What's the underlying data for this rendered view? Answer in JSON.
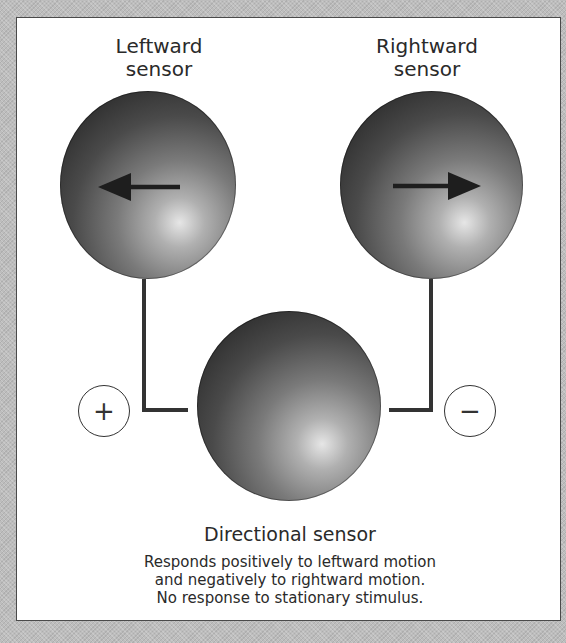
{
  "diagram": {
    "left_sensor": {
      "label_line1": "Leftward",
      "label_line2": "sensor",
      "arrow_direction": "left"
    },
    "right_sensor": {
      "label_line1": "Rightward",
      "label_line2": "sensor",
      "arrow_direction": "right"
    },
    "directional_sensor": {
      "title": "Directional sensor",
      "description_line1": "Responds positively to leftward motion",
      "description_line2": "and negatively to rightward motion.",
      "description_line3": "No response to stationary stimulus."
    },
    "left_connection_sign": "+",
    "right_connection_sign": "−",
    "colors": {
      "background": "#bdbdbd",
      "panel": "#ffffff",
      "connector": "#333333",
      "sphere_dark": "#232323",
      "sphere_highlight": "#e6e6e6"
    }
  }
}
